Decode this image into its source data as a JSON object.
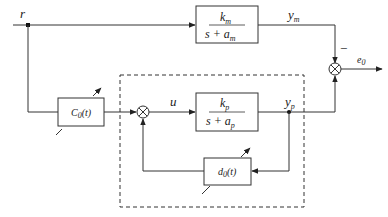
{
  "diagram": {
    "type": "block-diagram",
    "colors": {
      "line": "#333333",
      "background": "#ffffff",
      "dashed_border": "#333333"
    },
    "signals": {
      "reference": "r",
      "model_output_base": "y",
      "model_output_sub": "m",
      "plant_output_base": "y",
      "plant_output_sub": "p",
      "control": "u",
      "error_base": "e",
      "error_sub": "0",
      "minus_sign": "−"
    },
    "blocks": {
      "reference_model": {
        "num_base": "k",
        "num_sub": "m",
        "den_prefix": "s + a",
        "den_sub": "m"
      },
      "plant": {
        "num_base": "k",
        "num_sub": "p",
        "den_prefix": "s + a",
        "den_sub": "p"
      },
      "feedforward_gain": {
        "base": "C",
        "sub": "0",
        "suffix": "(t)"
      },
      "feedback_gain": {
        "base": "d",
        "sub": "0",
        "suffix": "(t)"
      }
    },
    "nodes": {
      "output_summer": "summing-junction",
      "inner_summer": "summing-junction"
    }
  }
}
